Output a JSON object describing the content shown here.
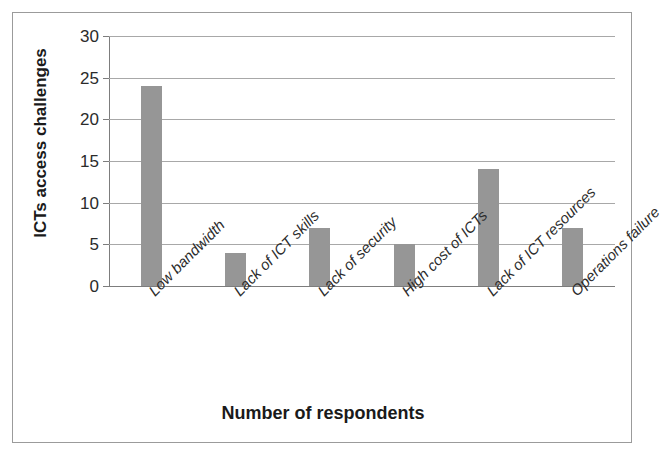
{
  "chart_data": {
    "type": "bar",
    "title": "",
    "xlabel": "Number of respondents",
    "ylabel": "ICTs access challenges",
    "categories": [
      "Low bandwidth",
      "Lack of ICT skills",
      "Lack of security",
      "High cost of ICTs",
      "Lack of ICT resources",
      "Operations failure"
    ],
    "values": [
      24,
      4,
      7,
      5,
      14,
      7
    ],
    "ylim": [
      0,
      30
    ],
    "ytick_labels": [
      "0",
      "5",
      "10",
      "15",
      "20",
      "25",
      "30"
    ],
    "ytick_values": [
      0,
      5,
      10,
      15,
      20,
      25,
      30
    ],
    "grid": true,
    "legend": "none",
    "bar_color": "#969696",
    "gridline_color": "#a8a8a8",
    "axis_color": "#7d7d7d",
    "frame_color": "#9b9b9b",
    "text_color": "#1a1a1a"
  }
}
